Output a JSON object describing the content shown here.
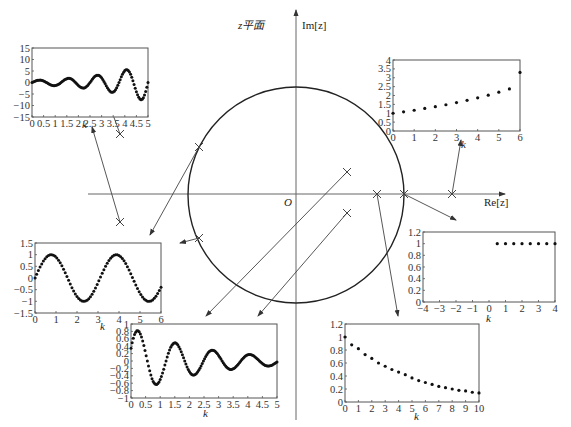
{
  "diagram": {
    "title": "z平面",
    "axis_imag": "Im[z]",
    "axis_real": "Re[z]",
    "origin": "O",
    "unit_circle": {
      "center_px": [
        296,
        195
      ],
      "radius_px": 108
    }
  },
  "poles": [
    {
      "name": "pole-left-upper",
      "px": [
        120,
        134
      ]
    },
    {
      "name": "pole-left-lower",
      "px": [
        120,
        222
      ]
    },
    {
      "name": "pole-circle-upper-left",
      "px": [
        199,
        147
      ]
    },
    {
      "name": "pole-circle-lower-left",
      "px": [
        199,
        238
      ]
    },
    {
      "name": "pole-inside-upper",
      "px": [
        347,
        172
      ]
    },
    {
      "name": "pole-inside-lower",
      "px": [
        347,
        213
      ]
    },
    {
      "name": "pole-real-inside",
      "px": [
        377,
        194
      ]
    },
    {
      "name": "pole-real-on-circle",
      "px": [
        404,
        194
      ]
    },
    {
      "name": "pole-real-outside",
      "px": [
        452,
        194
      ]
    }
  ],
  "chart_data": [
    {
      "id": "top-left",
      "type": "scatter",
      "title": "growing oscillation (complex poles outside unit circle)",
      "xlabel": "k",
      "ylabel": "",
      "xlim": [
        0,
        5
      ],
      "ylim": [
        -15,
        15
      ],
      "xticks": [
        "0",
        "0.5",
        "1",
        "1.5",
        "2",
        "2.5",
        "3",
        "3.5",
        "4",
        "4.5",
        "5"
      ],
      "yticks": [
        "15",
        "10",
        "5",
        "0",
        "-5",
        "-10",
        "-15"
      ]
    },
    {
      "id": "top-right",
      "type": "scatter",
      "title": "growing exponential (real pole > 1)",
      "xlabel": "k",
      "ylabel": "",
      "xlim": [
        0,
        6
      ],
      "ylim": [
        0,
        4
      ],
      "xticks": [
        "0",
        "1",
        "2",
        "3",
        "4",
        "5",
        "6"
      ],
      "yticks": [
        "4",
        "3.5",
        "3",
        "2.5",
        "2",
        "1.5",
        "1",
        "0.5",
        "0"
      ],
      "x": [
        0,
        0.5,
        1,
        1.5,
        2,
        2.5,
        3,
        3.5,
        4,
        4.5,
        5,
        5.5,
        6
      ],
      "values": [
        1.0,
        1.08,
        1.17,
        1.27,
        1.37,
        1.48,
        1.6,
        1.73,
        1.87,
        2.02,
        2.19,
        2.37,
        3.3
      ]
    },
    {
      "id": "middle-left",
      "type": "scatter",
      "title": "sustained oscillation (poles on unit circle)",
      "xlabel": "k",
      "ylabel": "",
      "xlim": [
        0,
        6
      ],
      "ylim": [
        -1.5,
        1.5
      ],
      "xticks": [
        "0",
        "1",
        "2",
        "3",
        "4",
        "5",
        "6"
      ],
      "yticks": [
        "1.5",
        "1",
        "0.5",
        "0",
        "-0.5",
        "-1",
        "-1.5"
      ]
    },
    {
      "id": "middle-right",
      "type": "scatter",
      "title": "step (pole at z=1)",
      "xlabel": "k",
      "ylabel": "",
      "xlim": [
        -4,
        4
      ],
      "ylim": [
        0,
        1.2
      ],
      "xticks": [
        "-4",
        "-3",
        "-2",
        "-1",
        "0",
        "1",
        "2",
        "3",
        "4"
      ],
      "yticks": [
        "1.2",
        "1",
        "0.8",
        "0.6",
        "0.4",
        "0.2",
        "0"
      ],
      "x": [
        0.5,
        1,
        1.5,
        2,
        2.5,
        3,
        3.5,
        4
      ],
      "values": [
        1,
        1,
        1,
        1,
        1,
        1,
        1,
        1
      ]
    },
    {
      "id": "bottom-center",
      "type": "scatter",
      "title": "damped oscillation (complex poles inside unit circle)",
      "xlabel": "k",
      "ylabel": "",
      "xlim": [
        0,
        5
      ],
      "ylim": [
        -1,
        1
      ],
      "xticks": [
        "0",
        "0.5",
        "1",
        "1.5",
        "2",
        "2.5",
        "3",
        "3.5",
        "4",
        "4.5",
        "5"
      ],
      "yticks": [
        "1",
        "0.8",
        "0.6",
        "0.4",
        "0.2",
        "0",
        "-0.2",
        "-0.4",
        "-0.6",
        "-0.8",
        "-1"
      ]
    },
    {
      "id": "bottom-right",
      "type": "scatter",
      "title": "decaying exponential (real pole inside unit circle)",
      "xlabel": "k",
      "ylabel": "",
      "xlim": [
        0,
        10
      ],
      "ylim": [
        0,
        1.2
      ],
      "xticks": [
        "0",
        "1",
        "2",
        "3",
        "4",
        "5",
        "6",
        "7",
        "8",
        "9",
        "10"
      ],
      "yticks": [
        "1.2",
        "1",
        "0.8",
        "0.6",
        "0.4",
        "0.2",
        "0"
      ],
      "x": [
        0,
        0.5,
        1,
        1.5,
        2,
        2.5,
        3,
        3.5,
        4,
        4.5,
        5,
        5.5,
        6,
        6.5,
        7,
        7.5,
        8,
        8.5,
        9,
        9.5,
        10
      ],
      "values": [
        1.0,
        0.88,
        0.82,
        0.73,
        0.67,
        0.6,
        0.55,
        0.5,
        0.46,
        0.42,
        0.37,
        0.33,
        0.3,
        0.27,
        0.24,
        0.22,
        0.2,
        0.18,
        0.17,
        0.15,
        0.14
      ]
    }
  ]
}
